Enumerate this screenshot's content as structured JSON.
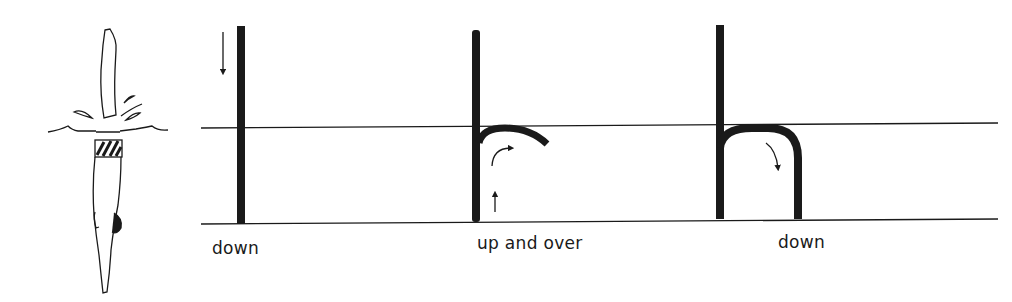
{
  "figure": {
    "steps": [
      {
        "label": "down",
        "arrow": "down"
      },
      {
        "label": "up and over",
        "arrow": "up-and-curve-right"
      },
      {
        "label": "down",
        "arrow": "curve-down"
      }
    ],
    "illustration": "diver entering water head-first",
    "colors": {
      "ink": "#1a1a1a",
      "background": "#ffffff"
    }
  }
}
